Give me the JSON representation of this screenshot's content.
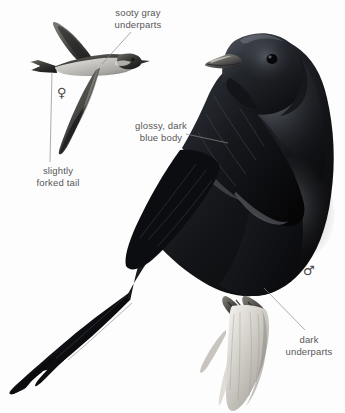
{
  "plate": {
    "background_color": "#fdfdfd",
    "ink_color": "#575757",
    "subject": "Purple Martin",
    "width": 345,
    "height": 413
  },
  "labels": {
    "sooty_gray_underparts": "sooty gray\nunderparts",
    "glossy_dark_blue_body": "glossy, dark\nblue body",
    "slightly_forked_tail": "slightly\nforked tail",
    "dark_underparts": "dark\nunderparts"
  },
  "symbols": {
    "female": "♀",
    "male": "♂"
  },
  "figures": [
    {
      "name": "flying-female-martin",
      "pose": "in flight, wings swept back",
      "sex": "female",
      "plumage": "sooty gray underparts, dark upperparts, slightly forked tail"
    },
    {
      "name": "perched-male-martin",
      "pose": "perched on broken branch stub, facing right",
      "sex": "male",
      "plumage": "glossy dark blue body, dark underparts"
    }
  ],
  "leader_lines": [
    {
      "name": "leader-sooty-gray",
      "from": [
        131,
        32
      ],
      "to": [
        102,
        64
      ]
    },
    {
      "name": "leader-forked-tail",
      "from": [
        52,
        72
      ],
      "to": [
        50,
        162
      ]
    },
    {
      "name": "leader-glossy-blue",
      "from": [
        186,
        134
      ],
      "to": [
        228,
        143
      ]
    },
    {
      "name": "leader-dark-under",
      "from": [
        264,
        288
      ],
      "to": [
        305,
        330
      ]
    }
  ]
}
